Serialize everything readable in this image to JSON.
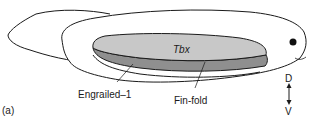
{
  "figure": {
    "panel_label": "(a)",
    "labels": {
      "tbx": "Tbx",
      "engrailed": "Engrailed–1",
      "finfold": "Fin-fold",
      "dorsal": "D",
      "ventral": "V"
    },
    "colors": {
      "outline": "#1a1a1a",
      "tbx_fill": "#c8c8c8",
      "engrailed_fill": "#8f8f8f",
      "body_fill": "#ffffff"
    }
  }
}
